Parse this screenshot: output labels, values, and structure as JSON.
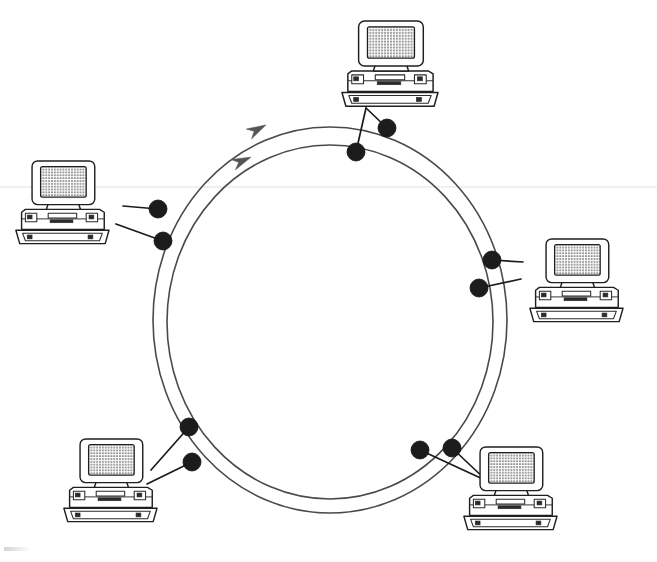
{
  "figure": {
    "kind": "network-topology-diagram",
    "caption": "",
    "background_color": "#ffffff",
    "ink_color": "#1f1f1f",
    "ring_stroke_color": "#4a4a4a",
    "node_fill_color": "#1c1c1c",
    "arrow_color": "#555555",
    "width": 657,
    "height": 562
  },
  "topology": {
    "ring_count": 2,
    "rings": [
      {
        "name": "outer-ring",
        "id": "ring-outer",
        "center_x": 330,
        "center_y": 320,
        "radius_x": 177,
        "radius_y": 193,
        "direction": "counter-clockwise"
      },
      {
        "name": "inner-ring",
        "id": "ring-inner",
        "center_x": 330,
        "center_y": 322,
        "radius_x": 163,
        "radius_y": 177,
        "direction": "counter-clockwise"
      }
    ],
    "flow_arrows": [
      {
        "name": "outer-ring-arrow",
        "ring": "outer-ring",
        "x": 264,
        "y": 126,
        "angle": -28
      },
      {
        "name": "inner-ring-arrow",
        "ring": "inner-ring",
        "x": 249,
        "y": 158,
        "angle": -23
      }
    ],
    "station_count": 6,
    "node_count": 12,
    "node_radius": 9,
    "stations": [
      {
        "id": "station-top",
        "label": "",
        "position": "top",
        "pc_x": 340,
        "pc_y": 20,
        "pc_scale": 0.98,
        "attach_x": 366,
        "attach_y": 108,
        "nodes": [
          {
            "name": "node-top-inner",
            "x": 356,
            "y": 152,
            "ring": "inner-ring"
          },
          {
            "name": "node-top-outer",
            "x": 387,
            "y": 128,
            "ring": "outer-ring"
          }
        ]
      },
      {
        "id": "station-left",
        "label": "",
        "position": "upper-left",
        "pc_x": 14,
        "pc_y": 160,
        "pc_scale": 0.95,
        "attach_x": 123,
        "attach_y": 208,
        "nodes": [
          {
            "name": "node-left-outer",
            "x": 158,
            "y": 209,
            "ring": "outer-ring"
          },
          {
            "name": "node-left-inner",
            "x": 163,
            "y": 241,
            "ring": "inner-ring"
          }
        ]
      },
      {
        "id": "station-right",
        "label": "",
        "position": "right",
        "pc_x": 528,
        "pc_y": 238,
        "pc_scale": 0.95,
        "attach_x": 518,
        "attach_y": 268,
        "nodes": [
          {
            "name": "node-right-outer",
            "x": 492,
            "y": 260,
            "ring": "outer-ring"
          },
          {
            "name": "node-right-inner",
            "x": 479,
            "y": 288,
            "ring": "inner-ring"
          }
        ]
      },
      {
        "id": "station-bottom-left",
        "label": "",
        "position": "bottom-left",
        "pc_x": 62,
        "pc_y": 438,
        "pc_scale": 0.95,
        "attach_x": 153,
        "attach_y": 468,
        "nodes": [
          {
            "name": "node-bottom-left-outer",
            "x": 189,
            "y": 427,
            "ring": "outer-ring"
          },
          {
            "name": "node-bottom-left-inner",
            "x": 192,
            "y": 462,
            "ring": "inner-ring"
          }
        ]
      },
      {
        "id": "station-bottom-right",
        "label": "",
        "position": "bottom-right",
        "pc_x": 462,
        "pc_y": 446,
        "pc_scale": 0.95,
        "attach_x": 487,
        "attach_y": 478,
        "nodes": [
          {
            "name": "node-bottom-right-inner",
            "x": 420,
            "y": 450,
            "ring": "inner-ring"
          },
          {
            "name": "node-bottom-right-outer",
            "x": 452,
            "y": 448,
            "ring": "outer-ring"
          }
        ]
      }
    ]
  },
  "icons": {
    "computer": "desktop-computer-icon",
    "node": "ring-node-icon",
    "arrow": "flow-direction-arrow-icon"
  }
}
